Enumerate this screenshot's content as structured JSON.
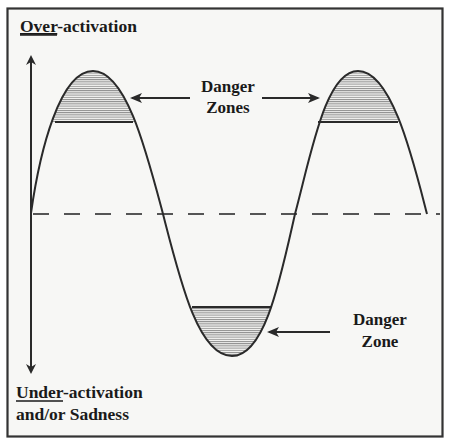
{
  "diagram": {
    "title": "",
    "axis": {
      "top_label_underlined": "Over",
      "top_label_rest": "-activation",
      "bottom_label_underlined": "Under",
      "bottom_label_rest": "-activation",
      "bottom_label_line2": "and/or Sadness"
    },
    "callouts": {
      "upper": {
        "line1": "Danger",
        "line2": "Zones"
      },
      "lower": {
        "line1": "Danger",
        "line2": "Zone"
      }
    },
    "curve": {
      "description": "Sine-like wave oscillating around a dashed baseline: rises to a peak, falls to a trough, rises to a second peak, returns to baseline",
      "extremes": [
        "peak",
        "trough",
        "peak"
      ],
      "shaded_regions": [
        "top of first peak",
        "bottom of trough",
        "top of second peak"
      ]
    },
    "colors": {
      "background": "#f7f7f5",
      "line": "#2a2a2a",
      "hatch": "#8a8a8a",
      "border": "#333333",
      "dashed_baseline": "#555555"
    }
  }
}
